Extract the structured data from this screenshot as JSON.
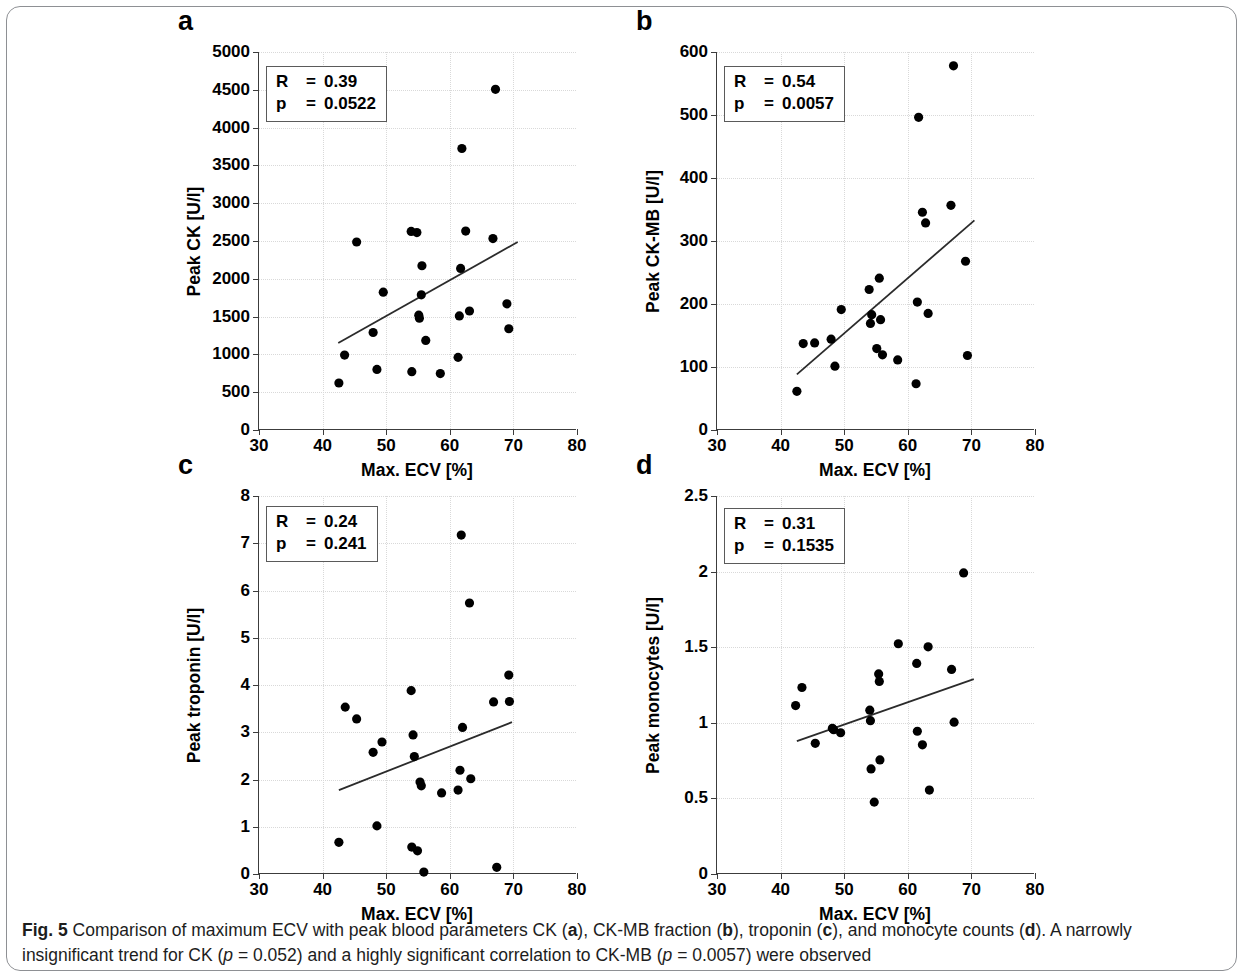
{
  "figure": {
    "caption_label": "Fig. 5",
    "caption_part1": " Comparison of maximum ECV with peak blood parameters CK (",
    "caption_a": "a",
    "caption_part2": "), CK-MB fraction (",
    "caption_b": "b",
    "caption_part3": "), troponin (",
    "caption_c": "c",
    "caption_part4": "), and monocyte counts (",
    "caption_d": "d",
    "caption_part5": "). A narrowly insignificant trend for CK (",
    "caption_p1_it": "p",
    "caption_p1_val": " = 0.052) and a highly significant correlation to CK-MB (",
    "caption_p2_it": "p",
    "caption_p2_val": " = 0.0057) were observed"
  },
  "chart_data": [
    {
      "panel": "a",
      "type": "scatter",
      "title": "",
      "xlabel": "Max. ECV [%]",
      "ylabel": "Peak CK [U/l]",
      "xlim": [
        30,
        80
      ],
      "ylim": [
        0,
        5000
      ],
      "xticks": [
        30,
        40,
        50,
        60,
        70,
        80
      ],
      "xticklabels": [
        "30",
        "40",
        "50",
        "60",
        "70",
        "80"
      ],
      "yticks": [
        0,
        500,
        1000,
        1500,
        2000,
        2500,
        3000,
        3500,
        4000,
        4500,
        5000
      ],
      "yticklabels": [
        "0",
        "500",
        "1000",
        "1500",
        "2000",
        "2500",
        "3000",
        "3500",
        "4000",
        "4500",
        "5000"
      ],
      "grid": true,
      "annotation": {
        "r_label": "R",
        "r_value": "0.39",
        "p_label": "p",
        "p_value": "0.0522",
        "eq": "="
      },
      "marker_color": "#000000",
      "line_color": "#2b2b2b",
      "fit_line": {
        "x": [
          42.5,
          70.8
        ],
        "y": [
          1140,
          2480
        ]
      },
      "points": [
        {
          "x": 42.6,
          "y": 610
        },
        {
          "x": 43.5,
          "y": 980
        },
        {
          "x": 45.4,
          "y": 2480
        },
        {
          "x": 48.0,
          "y": 1280
        },
        {
          "x": 48.6,
          "y": 790
        },
        {
          "x": 49.6,
          "y": 1815
        },
        {
          "x": 54.0,
          "y": 2620
        },
        {
          "x": 54.1,
          "y": 760
        },
        {
          "x": 54.9,
          "y": 2605
        },
        {
          "x": 55.2,
          "y": 1510
        },
        {
          "x": 55.3,
          "y": 1470
        },
        {
          "x": 55.6,
          "y": 1780
        },
        {
          "x": 55.7,
          "y": 2165
        },
        {
          "x": 56.3,
          "y": 1175
        },
        {
          "x": 58.6,
          "y": 735
        },
        {
          "x": 61.4,
          "y": 950
        },
        {
          "x": 61.6,
          "y": 1500
        },
        {
          "x": 61.8,
          "y": 2130
        },
        {
          "x": 62.0,
          "y": 3720
        },
        {
          "x": 62.6,
          "y": 2625
        },
        {
          "x": 63.2,
          "y": 1565
        },
        {
          "x": 66.9,
          "y": 2525
        },
        {
          "x": 67.3,
          "y": 4505
        },
        {
          "x": 69.1,
          "y": 1660
        },
        {
          "x": 69.4,
          "y": 1330
        }
      ]
    },
    {
      "panel": "b",
      "type": "scatter",
      "title": "",
      "xlabel": "Max. ECV [%]",
      "ylabel": "Peak CK-MB [U/l]",
      "xlim": [
        30,
        80
      ],
      "ylim": [
        0,
        600
      ],
      "xticks": [
        30,
        40,
        50,
        60,
        70,
        80
      ],
      "xticklabels": [
        "30",
        "40",
        "50",
        "60",
        "70",
        "80"
      ],
      "yticks": [
        0,
        100,
        200,
        300,
        400,
        500,
        600
      ],
      "yticklabels": [
        "0",
        "100",
        "200",
        "300",
        "400",
        "500",
        "600"
      ],
      "grid": true,
      "annotation": {
        "r_label": "R",
        "r_value": "0.54",
        "p_label": "p",
        "p_value": "0.0057",
        "eq": "="
      },
      "marker_color": "#000000",
      "line_color": "#2b2b2b",
      "fit_line": {
        "x": [
          42.6,
          70.6
        ],
        "y": [
          87,
          332
        ]
      },
      "points": [
        {
          "x": 42.6,
          "y": 60
        },
        {
          "x": 43.6,
          "y": 136
        },
        {
          "x": 45.4,
          "y": 137
        },
        {
          "x": 48.0,
          "y": 143
        },
        {
          "x": 48.6,
          "y": 100
        },
        {
          "x": 49.6,
          "y": 190
        },
        {
          "x": 54.0,
          "y": 222
        },
        {
          "x": 54.2,
          "y": 168
        },
        {
          "x": 54.4,
          "y": 182
        },
        {
          "x": 55.2,
          "y": 128
        },
        {
          "x": 55.6,
          "y": 240
        },
        {
          "x": 55.8,
          "y": 174
        },
        {
          "x": 56.1,
          "y": 118
        },
        {
          "x": 58.5,
          "y": 110
        },
        {
          "x": 61.4,
          "y": 72
        },
        {
          "x": 61.6,
          "y": 202
        },
        {
          "x": 61.8,
          "y": 496
        },
        {
          "x": 62.4,
          "y": 345
        },
        {
          "x": 62.9,
          "y": 328
        },
        {
          "x": 63.3,
          "y": 184
        },
        {
          "x": 66.9,
          "y": 356
        },
        {
          "x": 67.3,
          "y": 578
        },
        {
          "x": 69.2,
          "y": 267
        },
        {
          "x": 69.5,
          "y": 117
        }
      ]
    },
    {
      "panel": "c",
      "type": "scatter",
      "title": "",
      "xlabel": "Max. ECV [%]",
      "ylabel": "Peak troponin [U/l]",
      "xlim": [
        30,
        80
      ],
      "ylim": [
        0,
        8
      ],
      "xticks": [
        30,
        40,
        50,
        60,
        70,
        80
      ],
      "xticklabels": [
        "30",
        "40",
        "50",
        "60",
        "70",
        "80"
      ],
      "yticks": [
        0,
        1,
        2,
        3,
        4,
        5,
        6,
        7,
        8
      ],
      "yticklabels": [
        "0",
        "1",
        "2",
        "3",
        "4",
        "5",
        "6",
        "7",
        "8"
      ],
      "grid": true,
      "annotation": {
        "r_label": "R",
        "r_value": "0.24",
        "p_label": "p",
        "p_value": "0.241",
        "eq": "="
      },
      "marker_color": "#000000",
      "line_color": "#2b2b2b",
      "fit_line": {
        "x": [
          42.6,
          69.9
        ],
        "y": [
          1.76,
          3.2
        ]
      },
      "points": [
        {
          "x": 42.6,
          "y": 0.65
        },
        {
          "x": 43.6,
          "y": 3.52
        },
        {
          "x": 45.4,
          "y": 3.27
        },
        {
          "x": 48.0,
          "y": 2.56
        },
        {
          "x": 48.6,
          "y": 1.0
        },
        {
          "x": 49.4,
          "y": 2.78
        },
        {
          "x": 54.0,
          "y": 3.87
        },
        {
          "x": 54.1,
          "y": 0.55
        },
        {
          "x": 54.3,
          "y": 2.93
        },
        {
          "x": 54.5,
          "y": 2.47
        },
        {
          "x": 55.0,
          "y": 0.47
        },
        {
          "x": 55.4,
          "y": 1.93
        },
        {
          "x": 55.6,
          "y": 1.85
        },
        {
          "x": 56.0,
          "y": 0.02
        },
        {
          "x": 58.8,
          "y": 1.7
        },
        {
          "x": 61.4,
          "y": 1.76
        },
        {
          "x": 61.7,
          "y": 2.18
        },
        {
          "x": 62.1,
          "y": 3.09
        },
        {
          "x": 63.2,
          "y": 5.73
        },
        {
          "x": 63.4,
          "y": 2.0
        },
        {
          "x": 61.9,
          "y": 7.17
        },
        {
          "x": 67.0,
          "y": 3.63
        },
        {
          "x": 67.5,
          "y": 0.12
        },
        {
          "x": 69.4,
          "y": 4.2
        },
        {
          "x": 69.5,
          "y": 3.64
        }
      ]
    },
    {
      "panel": "d",
      "type": "scatter",
      "title": "",
      "xlabel": "Max. ECV [%]",
      "ylabel": "Peak monocytes [U/l]",
      "xlim": [
        30,
        80
      ],
      "ylim": [
        0,
        2.5
      ],
      "xticks": [
        30,
        40,
        50,
        60,
        70,
        80
      ],
      "xticklabels": [
        "30",
        "40",
        "50",
        "60",
        "70",
        "80"
      ],
      "yticks": [
        0,
        0.5,
        1,
        1.5,
        2,
        2.5
      ],
      "yticklabels": [
        "0",
        "0.5",
        "1",
        "1.5",
        "2",
        "2.5"
      ],
      "grid": true,
      "annotation": {
        "r_label": "R",
        "r_value": "0.31",
        "p_label": "p",
        "p_value": "0.1535",
        "eq": "="
      },
      "marker_color": "#000000",
      "line_color": "#2b2b2b",
      "fit_line": {
        "x": [
          42.6,
          70.5
        ],
        "y": [
          0.875,
          1.285
        ]
      },
      "points": [
        {
          "x": 42.4,
          "y": 1.11
        },
        {
          "x": 43.4,
          "y": 1.23
        },
        {
          "x": 45.5,
          "y": 0.86
        },
        {
          "x": 48.2,
          "y": 0.96
        },
        {
          "x": 48.4,
          "y": 0.95
        },
        {
          "x": 49.5,
          "y": 0.93
        },
        {
          "x": 54.1,
          "y": 1.08
        },
        {
          "x": 54.2,
          "y": 1.01
        },
        {
          "x": 54.3,
          "y": 0.69
        },
        {
          "x": 54.8,
          "y": 0.47
        },
        {
          "x": 55.5,
          "y": 1.32
        },
        {
          "x": 55.6,
          "y": 1.27
        },
        {
          "x": 55.7,
          "y": 0.75
        },
        {
          "x": 58.6,
          "y": 1.52
        },
        {
          "x": 61.5,
          "y": 1.39
        },
        {
          "x": 61.6,
          "y": 0.94
        },
        {
          "x": 62.4,
          "y": 0.85
        },
        {
          "x": 63.3,
          "y": 1.5
        },
        {
          "x": 63.5,
          "y": 0.55
        },
        {
          "x": 67.0,
          "y": 1.35
        },
        {
          "x": 67.4,
          "y": 1.0
        },
        {
          "x": 68.9,
          "y": 1.99
        }
      ]
    }
  ]
}
